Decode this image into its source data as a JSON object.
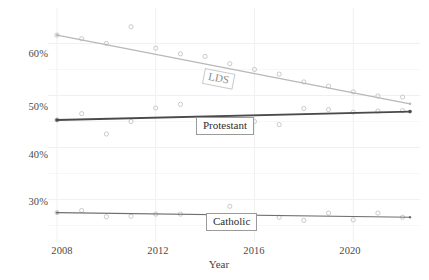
{
  "chart_data": {
    "type": "scatter",
    "title": "",
    "subtitle": "",
    "xlabel": "Year",
    "ylabel": "",
    "xlim": [
      2008,
      2022.3
    ],
    "ylim": [
      23.0,
      64.5
    ],
    "grid": true,
    "legend_position": "inline-labels",
    "x_ticks": [
      2008,
      2012,
      2016,
      2020
    ],
    "x_tick_labels": [
      "2008",
      "2012",
      "2016",
      "2020"
    ],
    "y_ticks": [
      30,
      40,
      50,
      60
    ],
    "y_tick_labels": [
      "30%",
      "40%",
      "50%",
      "60%"
    ],
    "series": [
      {
        "name": "LDS",
        "color": "#b8b8b8",
        "label_text": "LDS",
        "trend": {
          "x_start": 2008,
          "y_start": 61.6,
          "x_end": 2022.3,
          "y_end": 48.4
        },
        "points": [
          {
            "x": 2008,
            "y": 61.6
          },
          {
            "x": 2009,
            "y": 60.9
          },
          {
            "x": 2010,
            "y": 60.0
          },
          {
            "x": 2011,
            "y": 63.2
          },
          {
            "x": 2012,
            "y": 59.1
          },
          {
            "x": 2013,
            "y": 58.0
          },
          {
            "x": 2014,
            "y": 57.5
          },
          {
            "x": 2015,
            "y": 56.1
          },
          {
            "x": 2016,
            "y": 55.0
          },
          {
            "x": 2017,
            "y": 54.1
          },
          {
            "x": 2018,
            "y": 52.6
          },
          {
            "x": 2019,
            "y": 51.8
          },
          {
            "x": 2020,
            "y": 50.7
          },
          {
            "x": 2021,
            "y": 49.9
          },
          {
            "x": 2022,
            "y": 49.7
          }
        ]
      },
      {
        "name": "Protestant",
        "color": "#4a4a4a",
        "label_text": "Protestant",
        "trend": {
          "x_start": 2008,
          "y_start": 45.3,
          "x_end": 2022.3,
          "y_end": 46.9
        },
        "points": [
          {
            "x": 2008,
            "y": 45.3
          },
          {
            "x": 2009,
            "y": 46.5
          },
          {
            "x": 2010,
            "y": 42.6
          },
          {
            "x": 2011,
            "y": 45.0
          },
          {
            "x": 2012,
            "y": 47.6
          },
          {
            "x": 2013,
            "y": 48.3
          },
          {
            "x": 2016,
            "y": 45.0
          },
          {
            "x": 2017,
            "y": 44.4
          },
          {
            "x": 2018,
            "y": 47.5
          },
          {
            "x": 2019,
            "y": 47.3
          },
          {
            "x": 2020,
            "y": 46.8
          },
          {
            "x": 2021,
            "y": 47.0
          },
          {
            "x": 2022,
            "y": 47.1
          }
        ]
      },
      {
        "name": "Catholic",
        "color": "#6f6f6f",
        "label_text": "Catholic",
        "trend": {
          "x_start": 2008,
          "y_start": 27.5,
          "x_end": 2022.3,
          "y_end": 26.6
        },
        "points": [
          {
            "x": 2008,
            "y": 27.5
          },
          {
            "x": 2009,
            "y": 27.9
          },
          {
            "x": 2010,
            "y": 26.7
          },
          {
            "x": 2011,
            "y": 26.8
          },
          {
            "x": 2012,
            "y": 27.2
          },
          {
            "x": 2013,
            "y": 27.2
          },
          {
            "x": 2015,
            "y": 28.7
          },
          {
            "x": 2016,
            "y": 25.8
          },
          {
            "x": 2017,
            "y": 26.6
          },
          {
            "x": 2018,
            "y": 26.0
          },
          {
            "x": 2019,
            "y": 27.4
          },
          {
            "x": 2020,
            "y": 26.1
          },
          {
            "x": 2021,
            "y": 27.4
          },
          {
            "x": 2022,
            "y": 26.6
          }
        ]
      }
    ]
  },
  "axis": {
    "x_title": "Year",
    "y_tick_0": "30%",
    "y_tick_1": "40%",
    "y_tick_2": "50%",
    "y_tick_3": "60%",
    "x_tick_0": "2008",
    "x_tick_1": "2012",
    "x_tick_2": "2016",
    "x_tick_3": "2020"
  },
  "labels": {
    "lds": "LDS",
    "protestant": "Protestant",
    "catholic": "Catholic"
  },
  "colors": {
    "lds": "#b8b8b8",
    "protestant": "#4a4a4a",
    "catholic": "#6f6f6f",
    "grid": "#f0f0f0",
    "axis": "#9a9a9a",
    "background": "#ffffff"
  }
}
